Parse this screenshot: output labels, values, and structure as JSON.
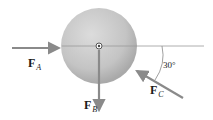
{
  "diagram": {
    "type": "free-body force diagram",
    "body": "sphere",
    "colors": {
      "sphere_fill": "#c8c8c8",
      "arrow": "#8a8a8a",
      "line": "#9a9a9a",
      "text": "#1a1a1a"
    },
    "forces": [
      {
        "name": "F",
        "subscript": "A",
        "direction": "horizontal, pointing right toward sphere"
      },
      {
        "name": "F",
        "subscript": "B",
        "direction": "vertical, pointing down from center"
      },
      {
        "name": "F",
        "subscript": "C",
        "direction": "pointing up-left toward sphere, 30° from vertical"
      }
    ],
    "angle_label": "30°"
  }
}
